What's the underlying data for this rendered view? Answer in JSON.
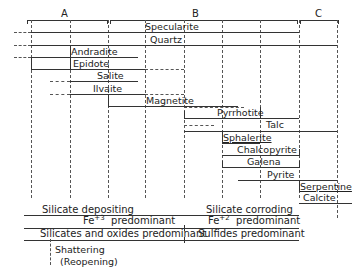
{
  "phases": [
    {
      "label": "A",
      "x_start": 27,
      "x_end": 107
    },
    {
      "label": "B",
      "x_start": 110,
      "x_end": 297
    },
    {
      "label": "C",
      "x_start": 300,
      "x_end": 338
    }
  ],
  "minerals": [
    {
      "name": "Specularite",
      "y": 32,
      "solid_start": 31,
      "solid_end": 299,
      "dashed_start": 14,
      "dashed_end": 31
    },
    {
      "name": "Quartz",
      "y": 45,
      "solid_start": 31,
      "solid_end": 337,
      "dashed_start": 14,
      "dashed_end": 31
    },
    {
      "name": "Andradite",
      "y": 57,
      "solid_start": 31,
      "solid_end": 138,
      "dashed_start": 14,
      "dashed_end": 31
    },
    {
      "name": "Epidote",
      "y": 69,
      "solid_start": 31,
      "solid_end": 145,
      "dashed_start": 145,
      "dashed_end": 184
    },
    {
      "name": "Salite",
      "y": 81,
      "solid_start": 70,
      "solid_end": 138,
      "dashed_start": 50,
      "dashed_end": 70
    },
    {
      "name": "Ilvaite",
      "y": 94,
      "solid_start": 70,
      "solid_end": 145,
      "dashed_start": 50,
      "dashed_end": 70
    },
    {
      "name": "Magnetite",
      "y": 106,
      "solid_start": 108,
      "solid_end": 184,
      "dashed_start": 145,
      "dashed_end": 240
    },
    {
      "name": "Pyrrhotite",
      "y": 118,
      "solid_start": 184,
      "solid_end": 299,
      "dashed_start": null,
      "dashed_end": null
    },
    {
      "name": "Talc",
      "y": 131,
      "solid_start": 184,
      "solid_end": 337,
      "dashed_start": null,
      "dashed_end": null
    },
    {
      "name": "Sphalerite",
      "y": 143,
      "solid_start": 222,
      "solid_end": 260,
      "dashed_start": 184,
      "dashed_end": 222
    },
    {
      "name": "Chalcopyrite",
      "y": 155,
      "solid_start": 222,
      "solid_end": 299,
      "dashed_start": null,
      "dashed_end": null
    },
    {
      "name": "Galena",
      "y": 167,
      "solid_start": 222,
      "solid_end": 299,
      "dashed_start": null,
      "dashed_end": null
    },
    {
      "name": "Pyrite",
      "y": 180,
      "solid_start": 238,
      "solid_end": 337,
      "dashed_start": null,
      "dashed_end": null
    },
    {
      "name": "Serpentine",
      "y": 192,
      "solid_start": 299,
      "solid_end": 337,
      "dashed_start": null,
      "dashed_end": null
    },
    {
      "name": "Calcite",
      "y": 203,
      "solid_start": 299,
      "solid_end": 352,
      "dashed_start": null,
      "dashed_end": null
    }
  ],
  "stages": [
    {
      "left": "Silicate depositing",
      "right": "Silicate corroding",
      "y": 215
    },
    {
      "left_prefix": "Fe",
      "left_sup": "+3",
      "left_suffix": "predominant",
      "right_prefix": "Fe",
      "right_sup": "+2",
      "right_suffix": "predominant",
      "y": 228
    },
    {
      "left": "Silicates and oxides predominant",
      "right": "Sulfides predominant",
      "y": 240
    }
  ],
  "legend": {
    "line1": "Shattering",
    "line2": "(Reopening)"
  }
}
